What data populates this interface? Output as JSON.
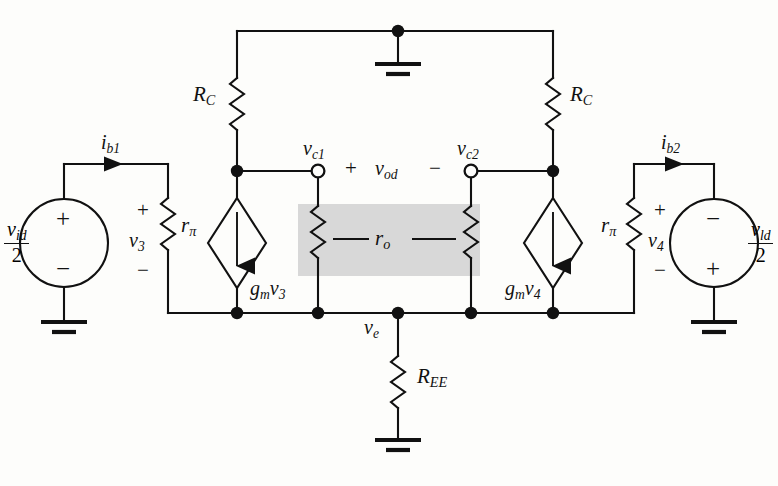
{
  "figure": {
    "type": "circuit-schematic",
    "shaded_region_color": "#d6d6d6",
    "line_color": "#111111",
    "background": "#fdfdfb"
  },
  "labels": {
    "rc_left": "R",
    "rc_left_sub": "C",
    "rc_right": "R",
    "rc_right_sub": "C",
    "ree": "R",
    "ree_sub": "EE",
    "ro": "r",
    "ro_sub": "o",
    "rpi_left": "r",
    "rpi_left_sub": "π",
    "rpi_right": "r",
    "rpi_right_sub": "π",
    "ib1": "i",
    "ib1_sub": "b1",
    "ib2": "i",
    "ib2_sub": "b2",
    "vc1": "v",
    "vc1_sub": "c1",
    "vc2": "v",
    "vc2_sub": "c2",
    "vod": "v",
    "vod_sub": "od",
    "ve": "v",
    "ve_sub": "e",
    "v3": "v",
    "v3_sub": "3",
    "v4": "v",
    "v4_sub": "4",
    "gmv3": "g",
    "gmv3_sub1": "m",
    "gmv3_v": "v",
    "gmv3_sub2": "3",
    "gmv4": "g",
    "gmv4_sub1": "m",
    "gmv4_v": "v",
    "gmv4_sub2": "4",
    "src_left_num": "v",
    "src_left_num_sub": "id",
    "src_left_den": "2",
    "src_right_num": "v",
    "src_right_num_sub": "ld",
    "src_right_den": "2",
    "plus": "+",
    "minus": "−"
  },
  "signs": {
    "src_left_top": "+",
    "src_left_bottom": "−",
    "src_right_top": "−",
    "src_right_bottom": "+",
    "v3_plus": "+",
    "v3_minus": "−",
    "v4_plus": "+",
    "v4_minus": "−",
    "vod_plus": "+",
    "vod_minus": "−"
  },
  "nodes": {
    "ground_top": "ground",
    "ground_left": "ground",
    "ground_right": "ground",
    "ground_ree": "ground"
  }
}
